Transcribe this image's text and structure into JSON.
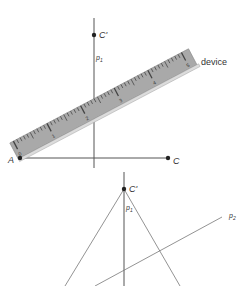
{
  "top_figure": {
    "points": {
      "A": {
        "label": "A",
        "x": 20,
        "y": 158
      },
      "C": {
        "label": "C",
        "x": 168,
        "y": 158
      },
      "C_prime": {
        "label": "C'",
        "x": 94,
        "y": 35
      }
    },
    "line_label": "p",
    "line_label_sub": "1",
    "device_label": "device",
    "ruler_numbers": [
      "0",
      "1",
      "2",
      "3",
      "4",
      "5"
    ]
  },
  "bottom_figure": {
    "C_prime": {
      "label": "C'",
      "x": 124,
      "y": 189
    },
    "p1_label": "p",
    "p1_sub": "1",
    "p2_label": "p",
    "p2_sub": "2"
  },
  "colors": {
    "line": "#555555",
    "ruler_fill": "#a9a9a9",
    "ruler_edge": "#d8d8d8",
    "point": "#222222"
  }
}
